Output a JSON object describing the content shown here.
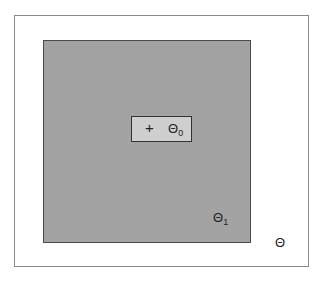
{
  "diagram": {
    "outer_set": {
      "symbol": "Θ",
      "subscript": ""
    },
    "region_1": {
      "symbol": "Θ",
      "subscript": "1",
      "fill": "#a3a3a3"
    },
    "region_0": {
      "symbol": "Θ",
      "subscript": "0",
      "fill": "#cfcfcf",
      "marker": "+"
    }
  }
}
